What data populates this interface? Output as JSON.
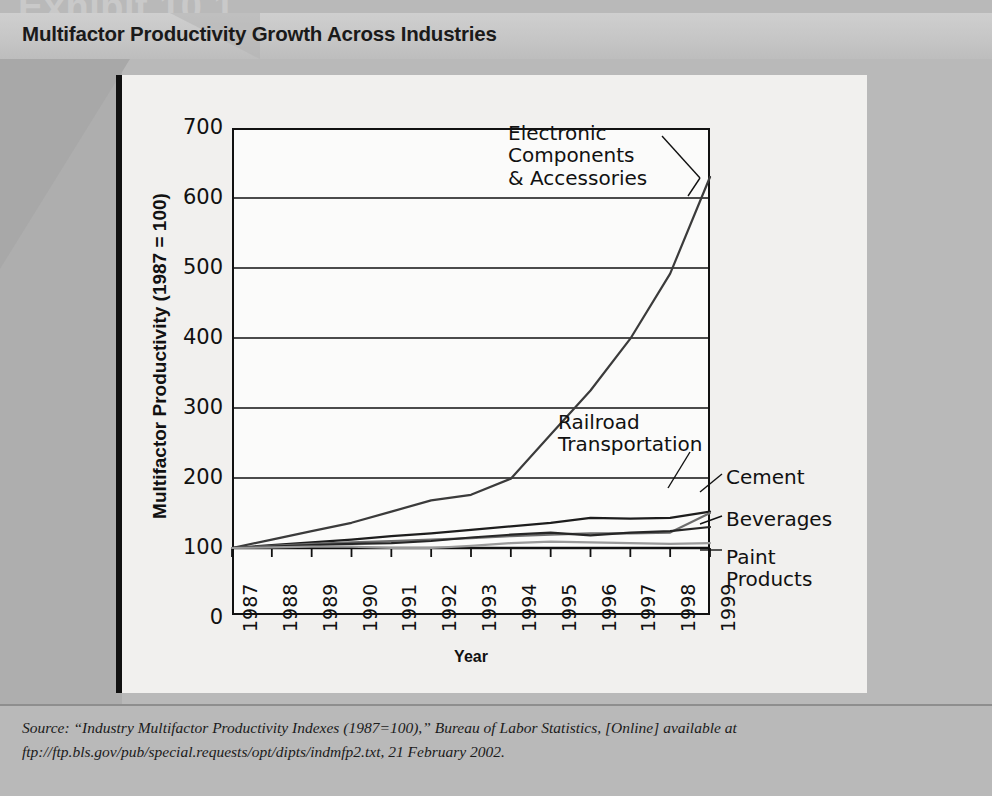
{
  "exhibit_number": "Exhibit 10.1",
  "header": {
    "title": "Multifactor Productivity Growth Across Industries"
  },
  "source_note": {
    "lead": "Source:",
    "quoted": "“Industry Multifactor Productivity Indexes (1987=100),”",
    "publisher": "Bureau of Labor Statistics,",
    "online": "[Online]",
    "available": "available at ftp://ftp.bls.gov/pub/special.requests/opt/dipts/indmfp2.txt, 21 February 2002.",
    "full": "Source: “Industry Multifactor Productivity Indexes (1987=100),” Bureau of Labor Statistics, [Online] available at ftp://ftp.bls.gov/pub/special.requests/opt/dipts/indmfp2.txt, 21 February 2002."
  },
  "colors": {
    "page_background": "#b9b9b9",
    "title_band": "#c6c6c6",
    "plot_card": "#f1f0ee",
    "plot_area": "#fbfbfa",
    "axis": "#111111",
    "electronics": "#3b3b3b",
    "railroad": "#1d1d1d",
    "cement": "#6e6e6e",
    "beverages": "#262626",
    "paint": "#9a9a9a"
  },
  "chart_data": {
    "type": "line",
    "title": "Multifactor Productivity Growth Across Industries",
    "xlabel": "Year",
    "ylabel": "Multifactor Productivity (1987 = 100)",
    "x": [
      1987,
      1988,
      1989,
      1990,
      1991,
      1992,
      1993,
      1994,
      1995,
      1996,
      1997,
      1998,
      1999
    ],
    "xtick_labels": [
      "1987",
      "1988",
      "1989",
      "1990",
      "1991",
      "1992",
      "1993",
      "1994",
      "1995",
      "1996",
      "1997",
      "1998",
      "1999"
    ],
    "ylim": [
      0,
      700
    ],
    "yticks": [
      0,
      100,
      200,
      300,
      400,
      500,
      600,
      700
    ],
    "ytick_labels": [
      "0",
      "100",
      "200",
      "300",
      "400",
      "500",
      "600",
      "700"
    ],
    "y_axis_break_below": 100,
    "grid": "horizontal",
    "legend": "annotations-inline",
    "series": [
      {
        "name": "Electronic Components & Accessories",
        "label": "Electronic\nComponents\n& Accessories",
        "color": "#3b3b3b",
        "values": [
          100,
          112,
          124,
          136,
          152,
          168,
          176,
          199,
          262,
          325,
          399,
          492,
          630
        ]
      },
      {
        "name": "Railroad Transportation",
        "label": "Railroad\nTransportation",
        "color": "#1d1d1d",
        "values": [
          100,
          104,
          108,
          112,
          117,
          121,
          126,
          131,
          136,
          143,
          142,
          143,
          152
        ]
      },
      {
        "name": "Cement",
        "label": "Cement",
        "color": "#6e6e6e",
        "values": [
          100,
          103,
          106,
          108,
          110,
          112,
          114,
          117,
          119,
          121,
          121,
          122,
          150
        ]
      },
      {
        "name": "Beverages",
        "label": "Beverages",
        "color": "#262626",
        "values": [
          100,
          102,
          104,
          106,
          107,
          110,
          115,
          119,
          122,
          118,
          122,
          124,
          130
        ]
      },
      {
        "name": "Paint Products",
        "label": "Paint\nProducts",
        "color": "#9a9a9a",
        "values": [
          100,
          101,
          102,
          102,
          100,
          100,
          103,
          107,
          109,
          108,
          107,
          106,
          107
        ]
      }
    ],
    "annotations": [
      {
        "text": "Electronic\nComponents\n& Accessories",
        "series": "Electronic Components & Accessories"
      },
      {
        "text": "Railroad\nTransportation",
        "series": "Railroad Transportation"
      },
      {
        "text": "Cement",
        "series": "Cement"
      },
      {
        "text": "Beverages",
        "series": "Beverages"
      },
      {
        "text": "Paint\nProducts",
        "series": "Paint Products"
      }
    ]
  }
}
